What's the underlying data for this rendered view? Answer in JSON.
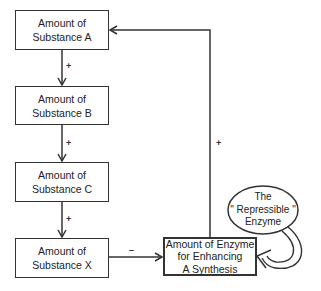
{
  "diagram": {
    "nodes": [
      {
        "id": "A",
        "line1": "Amount of",
        "line2": "Substance A"
      },
      {
        "id": "B",
        "line1": "Amount of",
        "line2": "Substance B"
      },
      {
        "id": "C",
        "line1": "Amount of",
        "line2": "Substance C"
      },
      {
        "id": "X",
        "line1": "Amount of",
        "line2": "Substance X"
      }
    ],
    "enzyme_box": {
      "line1": "Amount of Enzyme",
      "line2": "for  Enhancing",
      "line3": "A  Synthesis"
    },
    "repressible": {
      "line1": "The",
      "line2": "\" Repressible \"",
      "line3": "Enzyme"
    },
    "edges": [
      {
        "from": "A",
        "to": "B",
        "sign": "+"
      },
      {
        "from": "B",
        "to": "C",
        "sign": "+"
      },
      {
        "from": "C",
        "to": "X",
        "sign": "+"
      },
      {
        "from": "X",
        "to": "Enzyme",
        "sign": "–"
      },
      {
        "from": "Enzyme",
        "to": "A",
        "sign": "+"
      },
      {
        "from": "Repressible Enzyme",
        "to": "Enzyme",
        "sign": ""
      }
    ]
  }
}
